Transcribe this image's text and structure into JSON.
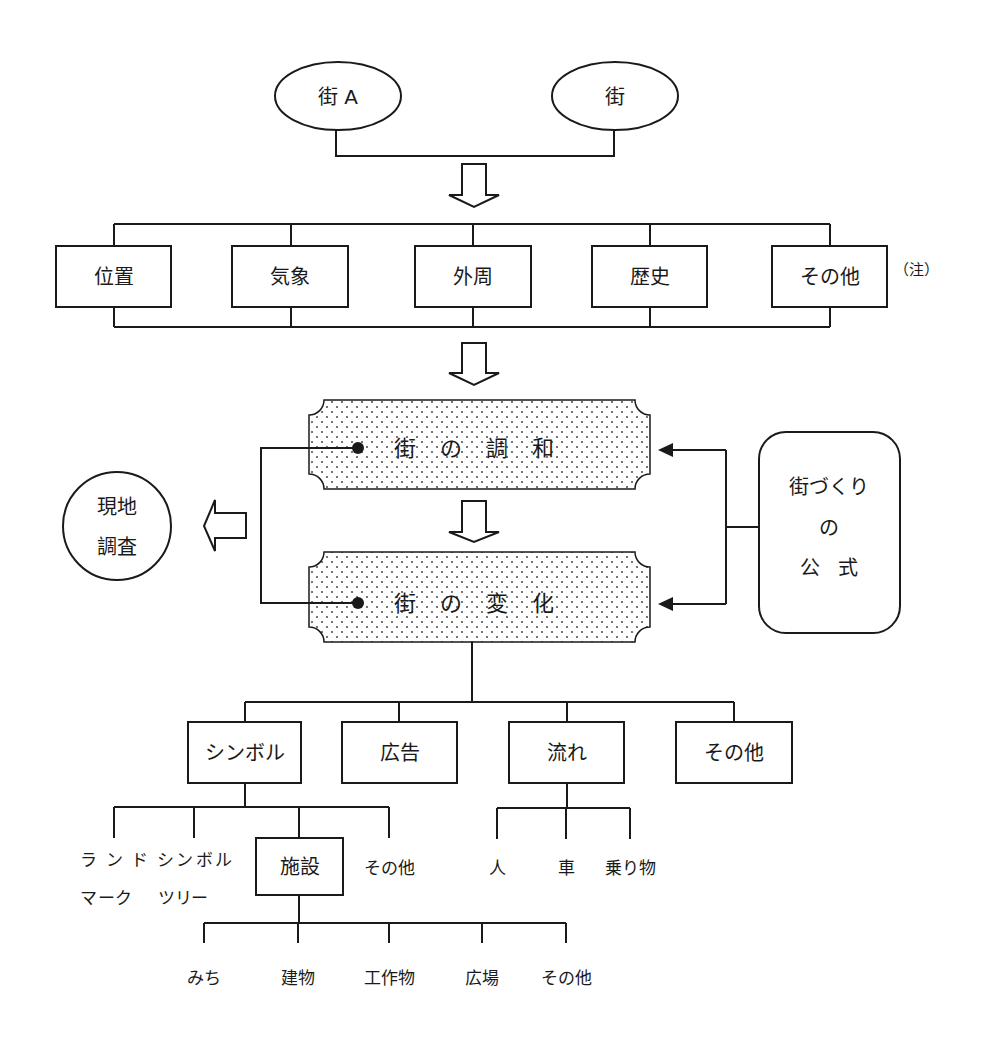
{
  "sources": {
    "town_a": "街 A",
    "town_b": "街"
  },
  "factors": {
    "items": [
      "位置",
      "気象",
      "外周",
      "歴史",
      "その他"
    ],
    "note": "（注）"
  },
  "core": {
    "harmony": "街の調和",
    "change": "街の変化"
  },
  "field_survey": {
    "line1": "現地",
    "line2": "調査"
  },
  "formula": {
    "line1": "街づくり",
    "line2": "の",
    "line3": "公式"
  },
  "elements": {
    "items": [
      "シンボル",
      "広告",
      "流れ",
      "その他"
    ]
  },
  "symbol_children": {
    "landmark_line1": "ランド",
    "landmark_line2": "マーク",
    "symbol_tree_line1": "シンボル",
    "symbol_tree_line2": "ツリー",
    "facility": "施設",
    "other": "その他"
  },
  "flow_children": [
    "人",
    "車",
    "乗り物"
  ],
  "facility_children": [
    "みち",
    "建物",
    "工作物",
    "広場",
    "その他"
  ],
  "colors": {
    "line": "#1a1a1a",
    "dots": "#555555",
    "background": "#ffffff"
  }
}
